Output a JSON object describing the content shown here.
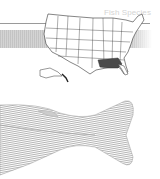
{
  "header": {
    "title": "Fish Species"
  },
  "map": {
    "region": "United States",
    "highlighted_region": "Gulf Coast states (Mississippi, Alabama, Georgia, Florida panhandle)",
    "colors": {
      "outline": "#333333",
      "highlight": "#4a4a4a",
      "fill": "#ffffff"
    }
  },
  "illustration": {
    "subject": "fish tail fin",
    "color": "#9a9a9a"
  }
}
